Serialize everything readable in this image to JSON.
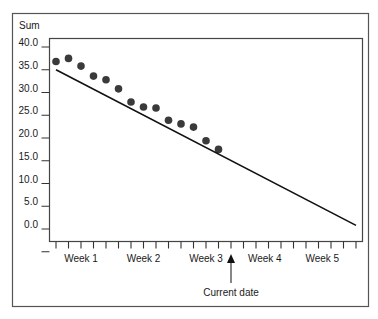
{
  "chart_data": {
    "type": "scatter",
    "title": "",
    "ylabel": "Sum",
    "xlabel": "",
    "ylim": [
      -2.5,
      43
    ],
    "y_ticks": [
      40,
      35,
      30,
      25,
      20,
      15,
      10,
      5,
      0,
      -5
    ],
    "y_tick_labels": [
      "40.0",
      "35.0",
      "30.0",
      "25.0",
      "20.0",
      "15.0",
      "10.0",
      "5.0",
      "0.0",
      ""
    ],
    "x_unit": "day",
    "x_days": 25,
    "x_labels": [
      {
        "text": "Week 1",
        "day": 2
      },
      {
        "text": "Week 2",
        "day": 7
      },
      {
        "text": "Week 3",
        "day": 12
      },
      {
        "text": "Week 4",
        "day": 16.7
      },
      {
        "text": "Week 5",
        "day": 21.3
      }
    ],
    "series": [
      {
        "name": "Actual",
        "kind": "points",
        "x": [
          0,
          1,
          2,
          3,
          4,
          5,
          6,
          7,
          8,
          9,
          10,
          11,
          12,
          13
        ],
        "values": [
          36.8,
          37.5,
          35.8,
          33.6,
          32.8,
          30.8,
          27.9,
          26.8,
          26.6,
          23.9,
          23.1,
          22.4,
          19.4,
          17.5
        ]
      },
      {
        "name": "Ideal",
        "kind": "line",
        "x": [
          0,
          24
        ],
        "values": [
          35.0,
          0.8
        ]
      }
    ],
    "annotations": [
      {
        "text": "Current date",
        "day": 14,
        "type": "arrow"
      }
    ],
    "grid": false,
    "legend": "none"
  }
}
